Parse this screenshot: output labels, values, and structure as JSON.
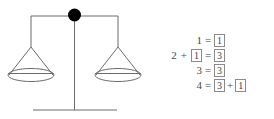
{
  "figure": {
    "name": "balance-scale-with-equations",
    "background_color": "#ffffff"
  },
  "scale": {
    "name": "balance-scale",
    "stroke_color": "#6b6b6b",
    "pivot_color": "#000000",
    "parts": {
      "beam_label": "beam",
      "pivot_label": "pivot",
      "post_label": "post",
      "base_label": "base",
      "left_pan_label": "left-pan",
      "right_pan_label": "right-pan"
    }
  },
  "equations": {
    "name": "equation-list",
    "equals_sign": "=",
    "plus_sign": "+",
    "rows": [
      {
        "lhs_prefix": "",
        "lhs_prefix_op": "",
        "lhs_boxed": "",
        "lhs_plain": "1",
        "rhs": [
          {
            "kind": "boxed",
            "text": "1"
          }
        ]
      },
      {
        "lhs_prefix": "2",
        "lhs_prefix_op": "+",
        "lhs_boxed": "1",
        "lhs_plain": "",
        "rhs": [
          {
            "kind": "boxed",
            "text": "3"
          }
        ]
      },
      {
        "lhs_prefix": "",
        "lhs_prefix_op": "",
        "lhs_boxed": "",
        "lhs_plain": "3",
        "rhs": [
          {
            "kind": "boxed",
            "text": "3"
          }
        ]
      },
      {
        "lhs_prefix": "",
        "lhs_prefix_op": "",
        "lhs_boxed": "",
        "lhs_plain": "4",
        "rhs": [
          {
            "kind": "boxed",
            "text": "3"
          },
          {
            "kind": "operator",
            "text": "+"
          },
          {
            "kind": "boxed",
            "text": "1"
          }
        ]
      }
    ]
  }
}
